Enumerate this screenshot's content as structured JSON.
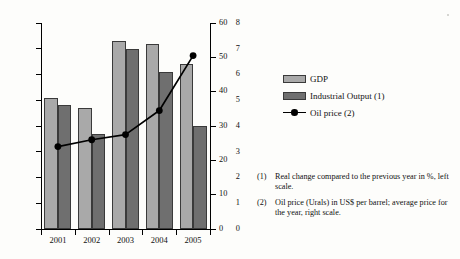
{
  "chart_data": {
    "type": "bar",
    "title": "",
    "xlabel": "",
    "ylabel": "",
    "categories": [
      "2001",
      "2002",
      "2003",
      "2004",
      "2005"
    ],
    "series": [
      {
        "name": "GDP",
        "type": "bar",
        "axis": "left",
        "values": [
          5.1,
          4.7,
          7.3,
          7.2,
          6.4
        ]
      },
      {
        "name": "Industrial Output (1)",
        "type": "bar",
        "axis": "left",
        "values": [
          4.8,
          3.7,
          7.0,
          6.1,
          4.0
        ]
      },
      {
        "name": "Oil price (2)",
        "type": "line",
        "axis": "right",
        "values": [
          24,
          26,
          27.5,
          34.5,
          50.5
        ]
      }
    ],
    "left_axis": {
      "label": "",
      "ylim": [
        0,
        8
      ],
      "ticks": [
        0,
        1,
        2,
        3,
        4,
        5,
        6,
        7,
        8
      ],
      "tick_labels": [
        "0",
        "1",
        "2",
        "3",
        "4",
        "5",
        "6",
        "7",
        "8"
      ]
    },
    "right_axis": {
      "label": "",
      "ylim": [
        0,
        60
      ],
      "ticks": [
        0,
        10,
        20,
        30,
        40,
        50,
        60
      ],
      "tick_labels": [
        "0",
        "10",
        "20",
        "30",
        "40",
        "50",
        "60"
      ]
    },
    "grid": false,
    "legend_position": "right"
  },
  "legend": {
    "items": [
      {
        "label": "GDP",
        "swatch": "light-gray-bar",
        "color": "#a9a9a9"
      },
      {
        "label": "Industrial Output (1)",
        "swatch": "dark-gray-bar",
        "color": "#6f6f6f"
      },
      {
        "label": "Oil price (2)",
        "swatch": "black-line-marker",
        "color": "#000000"
      }
    ]
  },
  "footnotes": [
    {
      "mark": "(1)",
      "text": "Real change compared to the previous year in %, left scale."
    },
    {
      "mark": "(2)",
      "text": "Oil price (Urals) in US$ per barrel; average price for the year, right scale."
    }
  ]
}
